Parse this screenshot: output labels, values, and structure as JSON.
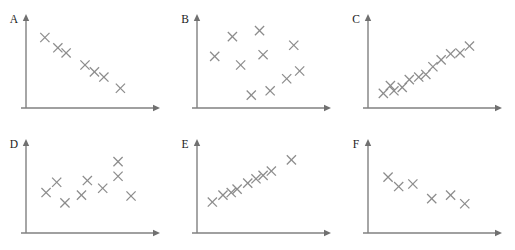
{
  "figure": {
    "title": "",
    "background_color": "#ffffff",
    "axis_color": "#808080",
    "marker_color": "#8c8c8c",
    "label_color": "#1a1a1a",
    "marker_glyph": "x",
    "rows": 2,
    "columns": 3,
    "panel_width": 171,
    "panel_height": 125
  },
  "chart_data": [
    {
      "type": "scatter",
      "title": "A",
      "xlabel": "",
      "ylabel": "",
      "xlim": [
        0,
        10
      ],
      "ylim": [
        0,
        10
      ],
      "grid": false,
      "legend": "none",
      "relationship": "strong negative",
      "n_points": 7,
      "x": [
        1.6,
        2.7,
        3.4,
        5.0,
        5.8,
        6.6,
        8.0
      ],
      "y": [
        8.2,
        7.0,
        6.4,
        5.0,
        4.2,
        3.6,
        2.3
      ]
    },
    {
      "type": "scatter",
      "title": "B",
      "xlabel": "",
      "ylabel": "",
      "xlim": [
        0,
        10
      ],
      "ylim": [
        0,
        10
      ],
      "grid": false,
      "legend": "none",
      "relationship": "no correlation",
      "n_points": 10,
      "x": [
        1.5,
        3.0,
        3.7,
        5.3,
        5.6,
        6.2,
        7.6,
        8.2,
        8.7,
        4.6
      ],
      "y": [
        6.0,
        8.3,
        5.0,
        9.0,
        6.2,
        2.0,
        3.4,
        7.3,
        4.3,
        1.5
      ]
    },
    {
      "type": "scatter",
      "title": "C",
      "xlabel": "",
      "ylabel": "",
      "xlim": [
        0,
        10
      ],
      "ylim": [
        0,
        10
      ],
      "grid": false,
      "legend": "none",
      "relationship": "strong positive",
      "n_points": 12,
      "x": [
        1.3,
        1.9,
        2.2,
        2.9,
        3.5,
        4.3,
        4.9,
        5.5,
        6.2,
        7.0,
        7.8,
        8.6
      ],
      "y": [
        1.7,
        2.6,
        2.0,
        2.4,
        3.3,
        3.6,
        3.9,
        4.8,
        5.6,
        6.3,
        6.4,
        7.2
      ]
    },
    {
      "type": "scatter",
      "title": "D",
      "xlabel": "",
      "ylabel": "",
      "xlim": [
        0,
        10
      ],
      "ylim": [
        0,
        10
      ],
      "grid": false,
      "legend": "none",
      "relationship": "no correlation",
      "n_points": 9,
      "x": [
        1.7,
        2.6,
        3.3,
        4.7,
        5.2,
        6.5,
        7.8,
        7.8,
        8.9
      ],
      "y": [
        4.7,
        5.9,
        3.5,
        4.4,
        6.1,
        5.2,
        8.3,
        6.6,
        4.3
      ]
    },
    {
      "type": "scatter",
      "title": "E",
      "xlabel": "",
      "ylabel": "",
      "xlim": [
        0,
        10
      ],
      "ylim": [
        0,
        10
      ],
      "grid": false,
      "legend": "none",
      "relationship": "strong positive linear",
      "n_points": 9,
      "x": [
        1.3,
        2.2,
        2.9,
        3.4,
        4.3,
        5.0,
        5.6,
        6.3,
        8.0
      ],
      "y": [
        3.6,
        4.4,
        4.7,
        5.1,
        5.8,
        6.3,
        6.7,
        7.2,
        8.5
      ]
    },
    {
      "type": "scatter",
      "title": "F",
      "xlabel": "",
      "ylabel": "",
      "xlim": [
        0,
        10
      ],
      "ylim": [
        0,
        10
      ],
      "grid": false,
      "legend": "none",
      "relationship": "moderate negative",
      "n_points": 6,
      "x": [
        1.7,
        2.6,
        3.8,
        5.4,
        7.0,
        8.2
      ],
      "y": [
        6.5,
        5.4,
        5.7,
        4.0,
        4.4,
        3.4
      ]
    }
  ]
}
